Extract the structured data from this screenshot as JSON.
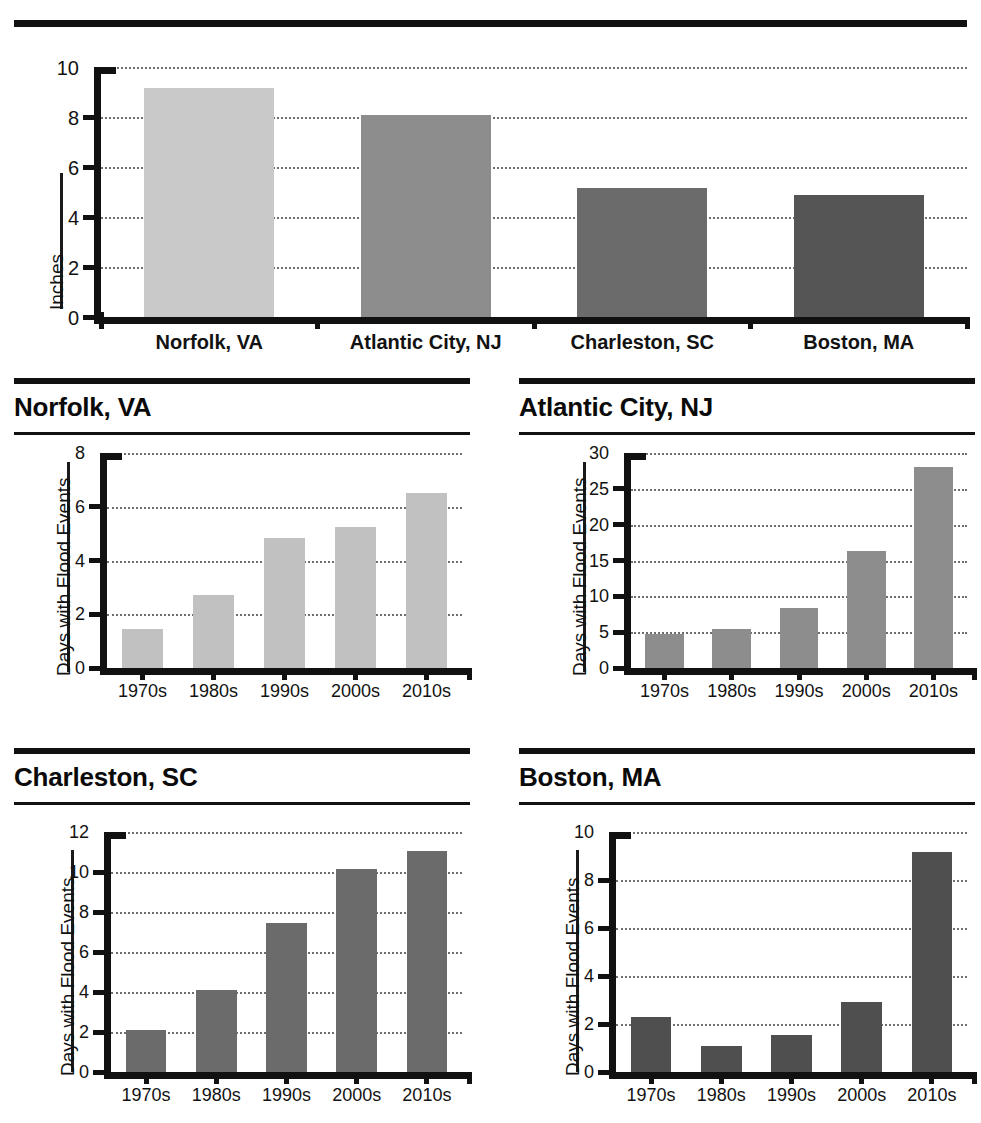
{
  "chart_data": [
    {
      "id": "summary",
      "type": "bar",
      "title": "",
      "xlabel": "",
      "ylabel": "Inches",
      "categories": [
        "Norfolk, VA",
        "Atlantic City, NJ",
        "Charleston, SC",
        "Boston, MA"
      ],
      "values": [
        9.15,
        8.1,
        5.15,
        4.9
      ],
      "ylim": [
        0,
        10
      ],
      "yticks": [
        0,
        2,
        4,
        6,
        8,
        10
      ],
      "ytick_labels": [
        "0",
        "2",
        "4",
        "6",
        "8",
        "10"
      ],
      "grid": true,
      "legend": "none",
      "bar_colors": [
        "#c9c9c9",
        "#8d8d8d",
        "#6b6b6b",
        "#555555"
      ]
    },
    {
      "id": "norfolk",
      "type": "bar",
      "title": "Norfolk, VA",
      "xlabel": "",
      "ylabel": "Days with Flood Events",
      "categories": [
        "1970s",
        "1980s",
        "1990s",
        "2000s",
        "2010s"
      ],
      "values": [
        1.45,
        2.7,
        4.85,
        5.25,
        6.5
      ],
      "ylim": [
        0,
        8
      ],
      "yticks": [
        0,
        2,
        4,
        6,
        8
      ],
      "ytick_labels": [
        "0",
        "2",
        "4",
        "6",
        "8"
      ],
      "grid": true,
      "legend": "none",
      "bar_color": "#c1c1c1"
    },
    {
      "id": "atlantic",
      "type": "bar",
      "title": "Atlantic City, NJ",
      "xlabel": "",
      "ylabel": "Days with Flood Events",
      "categories": [
        "1970s",
        "1980s",
        "1990s",
        "2000s",
        "2010s"
      ],
      "values": [
        4.8,
        5.4,
        8.4,
        16.3,
        28.0
      ],
      "ylim": [
        0,
        30
      ],
      "yticks": [
        0,
        5,
        10,
        15,
        20,
        25,
        30
      ],
      "ytick_labels": [
        "0",
        "5",
        "10",
        "15",
        "20",
        "25",
        "30"
      ],
      "grid": true,
      "legend": "none",
      "bar_color": "#8d8d8d"
    },
    {
      "id": "charleston",
      "type": "bar",
      "title": "Charleston, SC",
      "xlabel": "",
      "ylabel": "Days with Flood Events",
      "categories": [
        "1970s",
        "1980s",
        "1990s",
        "2000s",
        "2010s"
      ],
      "values": [
        2.1,
        4.1,
        7.45,
        10.15,
        11.05
      ],
      "ylim": [
        0,
        12
      ],
      "yticks": [
        0,
        2,
        4,
        6,
        8,
        10,
        12
      ],
      "ytick_labels": [
        "0",
        "2",
        "4",
        "6",
        "8",
        "10",
        "12"
      ],
      "grid": true,
      "legend": "none",
      "bar_color": "#6b6b6b"
    },
    {
      "id": "boston",
      "type": "bar",
      "title": "Boston, MA",
      "xlabel": "",
      "ylabel": "Days with Flood Events",
      "categories": [
        "1970s",
        "1980s",
        "1990s",
        "2000s",
        "2010s"
      ],
      "values": [
        2.3,
        1.1,
        1.55,
        2.9,
        9.15
      ],
      "ylim": [
        0,
        10
      ],
      "yticks": [
        0,
        2,
        4,
        6,
        8,
        10
      ],
      "ytick_labels": [
        "0",
        "2",
        "4",
        "6",
        "8",
        "10"
      ],
      "grid": true,
      "legend": "none",
      "bar_color": "#4f4f4f"
    }
  ],
  "colors": {
    "ink": "#111111",
    "grid": "#6e6e6e",
    "background": "#ffffff"
  }
}
